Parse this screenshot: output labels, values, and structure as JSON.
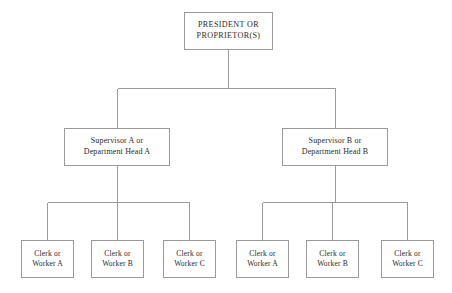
{
  "chart": {
    "type": "org-chart",
    "canvas": {
      "width": 452,
      "height": 293
    },
    "colors": {
      "background": "#ffffff",
      "line": "#9a9a9a",
      "box_border": "#9a9a9a",
      "text": "#2a2a2a"
    },
    "root": {
      "id": "president",
      "line_1": "PRESIDENT OR",
      "line_2": "PROPRIETOR(S)",
      "center_x": 228,
      "box": {
        "x": 184,
        "y": 12,
        "w": 89,
        "h": 38
      }
    },
    "levels": [
      {
        "name": "executive",
        "nodes": [
          {
            "id": "president",
            "label": "PRESIDENT OR PROPRIETOR(S)"
          }
        ]
      },
      {
        "name": "supervisors",
        "bus_y": 88,
        "nodes": [
          {
            "id": "supervisor-a",
            "line_1": "Supervisor A or",
            "line_2": "Department Head A",
            "center_x": 117,
            "box": {
              "x": 64,
              "y": 128,
              "w": 106,
              "h": 38
            }
          },
          {
            "id": "supervisor-b",
            "line_1": "Supervisor B or",
            "line_2": "Department Head B",
            "center_x": 335,
            "box": {
              "x": 282,
              "y": 128,
              "w": 106,
              "h": 38
            }
          }
        ]
      },
      {
        "name": "workers",
        "bus_y": 202,
        "nodes": [
          {
            "id": "clerk-a-1",
            "parent": "supervisor-a",
            "line_1": "Clerk or",
            "line_2": "Worker A",
            "center_x": 47,
            "box": {
              "x": 21,
              "y": 240,
              "w": 53,
              "h": 38
            }
          },
          {
            "id": "clerk-a-2",
            "parent": "supervisor-a",
            "line_1": "Clerk or",
            "line_2": "Worker B",
            "center_x": 117,
            "box": {
              "x": 91,
              "y": 240,
              "w": 53,
              "h": 38
            }
          },
          {
            "id": "clerk-a-3",
            "parent": "supervisor-a",
            "line_1": "Clerk or",
            "line_2": "Worker C",
            "center_x": 189,
            "box": {
              "x": 163,
              "y": 240,
              "w": 53,
              "h": 38
            }
          },
          {
            "id": "clerk-b-1",
            "parent": "supervisor-b",
            "line_1": "Clerk or",
            "line_2": "Worker A",
            "center_x": 262,
            "box": {
              "x": 236,
              "y": 240,
              "w": 53,
              "h": 38
            }
          },
          {
            "id": "clerk-b-2",
            "parent": "supervisor-b",
            "line_1": "Clerk or",
            "line_2": "Worker B",
            "center_x": 332,
            "box": {
              "x": 306,
              "y": 240,
              "w": 53,
              "h": 38
            }
          },
          {
            "id": "clerk-b-3",
            "parent": "supervisor-b",
            "line_1": "Clerk or",
            "line_2": "Worker C",
            "center_x": 407,
            "box": {
              "x": 381,
              "y": 240,
              "w": 53,
              "h": 38
            }
          }
        ]
      }
    ]
  }
}
